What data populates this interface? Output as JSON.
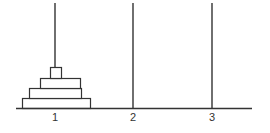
{
  "diagram": {
    "type": "tower-of-hanoi",
    "stroke_color": "#333333",
    "background": "#ffffff",
    "base": {
      "x1": 16,
      "x2": 252,
      "y": 108
    },
    "pegs": [
      {
        "id": 1,
        "label": "1",
        "x": 55,
        "top": 3
      },
      {
        "id": 2,
        "label": "2",
        "x": 133,
        "top": 3
      },
      {
        "id": 3,
        "label": "3",
        "x": 212,
        "top": 3
      }
    ],
    "disks": [
      {
        "size": 4,
        "peg": 1,
        "x": 22,
        "y": 98,
        "w": 68,
        "h": 10
      },
      {
        "size": 3,
        "peg": 1,
        "x": 29,
        "y": 88,
        "w": 52,
        "h": 10
      },
      {
        "size": 2,
        "peg": 1,
        "x": 40,
        "y": 78,
        "w": 40,
        "h": 10
      },
      {
        "size": 1,
        "peg": 1,
        "x": 50,
        "y": 67,
        "w": 11,
        "h": 11
      }
    ],
    "label_y": 121
  }
}
